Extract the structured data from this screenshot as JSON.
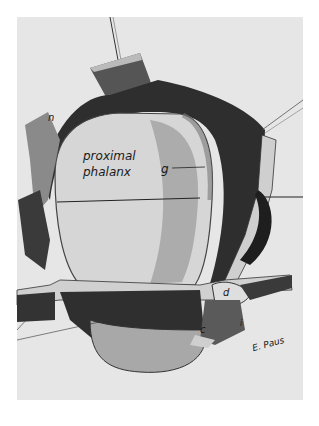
{
  "figure": {
    "type": "anatomical illustration (pencil/ink drawing)",
    "labels": {
      "proximal": "proximal",
      "phalanx": "phalanx",
      "g": "g",
      "n": "n",
      "d": "d",
      "c": "c",
      "i": "i"
    },
    "signature": "E. Paus",
    "colors": {
      "paper": "#e6e6e6",
      "border": "#ffffff",
      "ink": "#1a1a1a",
      "shade_dark": "#2a2a2a",
      "shade_mid": "#8a8a8a",
      "bone": "#d4d4d4"
    }
  }
}
